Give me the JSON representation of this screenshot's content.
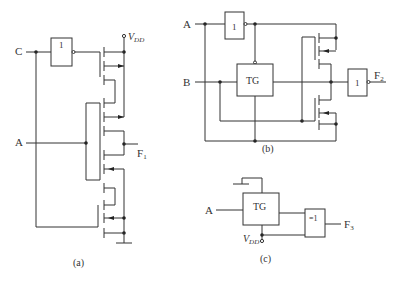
{
  "diagrams": [
    {
      "id": "a",
      "caption": "(a)",
      "inputs": [
        "C",
        "A"
      ],
      "output": "F",
      "output_sub": "1",
      "supply": "V",
      "supply_sub": "DD",
      "gate_label": "1"
    },
    {
      "id": "b",
      "caption": "(b)",
      "inputs": [
        "A",
        "B"
      ],
      "output": "F",
      "output_sub": "2",
      "tg_label": "TG",
      "inverter_label": "1",
      "output_inverter_label": "1"
    },
    {
      "id": "c",
      "caption": "(c)",
      "inputs": [
        "A"
      ],
      "output": "F",
      "output_sub": "3",
      "tg_label": "TG",
      "xor_label": "=1",
      "supply": "V",
      "supply_sub": "DD"
    }
  ]
}
